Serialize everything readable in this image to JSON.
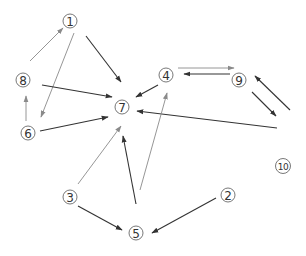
{
  "diagram": {
    "type": "directed-graph",
    "nodes": [
      {
        "id": "1",
        "label": "1",
        "x": 70,
        "y": 21
      },
      {
        "id": "2",
        "label": "2",
        "x": 228,
        "y": 195
      },
      {
        "id": "3",
        "label": "3",
        "x": 70,
        "y": 197
      },
      {
        "id": "4",
        "label": "4",
        "x": 166,
        "y": 75
      },
      {
        "id": "5",
        "label": "5",
        "x": 136,
        "y": 233
      },
      {
        "id": "6",
        "label": "6",
        "x": 28,
        "y": 133
      },
      {
        "id": "7",
        "label": "7",
        "x": 122,
        "y": 107
      },
      {
        "id": "8",
        "label": "8",
        "x": 23,
        "y": 80
      },
      {
        "id": "9",
        "label": "9",
        "x": 239,
        "y": 80
      },
      {
        "id": "10",
        "label": "10",
        "x": 283,
        "y": 166
      }
    ],
    "edges": [
      {
        "from": "8",
        "to": "1",
        "x1": 30,
        "y1": 61,
        "x2": 63,
        "y2": 28,
        "color": "#8a8a8a"
      },
      {
        "from": "1",
        "to": "6",
        "x1": 74,
        "y1": 33,
        "x2": 41,
        "y2": 117,
        "color": "#8a8a8a"
      },
      {
        "from": "1",
        "to": "7",
        "x1": 86,
        "y1": 36,
        "x2": 121,
        "y2": 82,
        "color": "#333333"
      },
      {
        "from": "8",
        "to": "7",
        "x1": 42,
        "y1": 85,
        "x2": 112,
        "y2": 97,
        "color": "#333333"
      },
      {
        "from": "6",
        "to": "8",
        "x1": 26,
        "y1": 121,
        "x2": 26,
        "y2": 96,
        "color": "#8a8a8a"
      },
      {
        "from": "6",
        "to": "7",
        "x1": 40,
        "y1": 131,
        "x2": 108,
        "y2": 117,
        "color": "#333333"
      },
      {
        "from": "4",
        "to": "7",
        "x1": 158,
        "y1": 85,
        "x2": 136,
        "y2": 97,
        "color": "#333333"
      },
      {
        "from": "4",
        "to": "9",
        "x1": 178,
        "y1": 68,
        "x2": 234,
        "y2": 68,
        "color": "#8a8a8a"
      },
      {
        "from": "9",
        "to": "4",
        "x1": 230,
        "y1": 74,
        "x2": 184,
        "y2": 74,
        "color": "#333333"
      },
      {
        "from": "10",
        "to": "9",
        "x1": 290,
        "y1": 110,
        "x2": 255,
        "y2": 76,
        "color": "#333333"
      },
      {
        "from": "9",
        "to": "10",
        "x1": 252,
        "y1": 92,
        "x2": 276,
        "y2": 116,
        "color": "#333333"
      },
      {
        "from": "10",
        "to": "7",
        "x1": 277,
        "y1": 128,
        "x2": 137,
        "y2": 111,
        "color": "#333333"
      },
      {
        "from": "3",
        "to": "7",
        "x1": 78,
        "y1": 184,
        "x2": 121,
        "y2": 126,
        "color": "#8a8a8a"
      },
      {
        "from": "3",
        "to": "5",
        "x1": 78,
        "y1": 206,
        "x2": 122,
        "y2": 230,
        "color": "#333333"
      },
      {
        "from": "5",
        "to": "7",
        "x1": 136,
        "y1": 204,
        "x2": 123,
        "y2": 136,
        "color": "#333333"
      },
      {
        "from": "5",
        "to": "4",
        "x1": 140,
        "y1": 190,
        "x2": 167,
        "y2": 93,
        "color": "#8a8a8a"
      },
      {
        "from": "2",
        "to": "5",
        "x1": 216,
        "y1": 198,
        "x2": 152,
        "y2": 233,
        "color": "#333333"
      }
    ]
  }
}
